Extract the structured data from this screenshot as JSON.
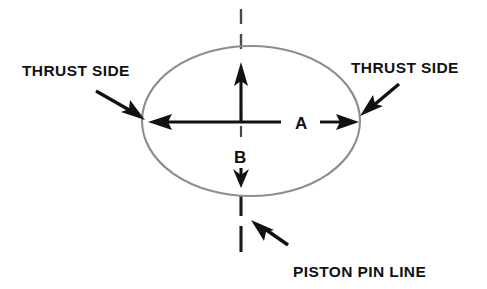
{
  "diagram": {
    "background_color": "#ffffff",
    "ellipse_color": "#8d8d8d",
    "line_color": "#111111",
    "labels": {
      "thrust_side_left": "THRUST SIDE",
      "thrust_side_right": "THRUST SIDE",
      "piston_pin_line": "PISTON PIN LINE",
      "axis_a": "A",
      "axis_b": "B"
    },
    "icons": {
      "pointer_left": "arrow-down-right-icon",
      "pointer_right": "arrow-down-left-icon",
      "pointer_pin": "arrow-up-left-icon",
      "axis_a_left": "arrow-left-icon",
      "axis_a_right": "arrow-right-icon",
      "axis_b_up": "arrow-up-icon",
      "axis_b_down": "arrow-down-icon"
    },
    "shape": {
      "name": "piston-outline-ellipse",
      "center_x": 251,
      "center_y": 121,
      "radius_x": 109,
      "radius_y": 75
    },
    "pin_line": {
      "name": "piston-pin-center-line",
      "style": "dashed",
      "x": 241,
      "y_top": 8,
      "y_bottom": 258
    }
  }
}
